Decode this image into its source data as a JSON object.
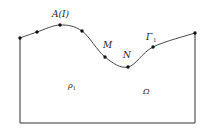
{
  "diagram": {
    "colors": {
      "stroke": "#333333",
      "point": "#111111",
      "background": "#ffffff"
    },
    "domain": {
      "left": 20,
      "right": 195,
      "bottom": 123,
      "top_left_y": 38,
      "top_right_y": 33
    },
    "points": [
      {
        "x": 20,
        "y": 38
      },
      {
        "x": 37,
        "y": 32
      },
      {
        "x": 60,
        "y": 25
      },
      {
        "x": 82,
        "y": 31
      },
      {
        "x": 105,
        "y": 57
      },
      {
        "x": 128,
        "y": 67
      },
      {
        "x": 153,
        "y": 47
      },
      {
        "x": 195,
        "y": 33
      }
    ],
    "labels": {
      "a": {
        "main": "A",
        "paren": "(I)",
        "x": 52,
        "y": 17
      },
      "m": {
        "main": "M",
        "x": 103,
        "y": 48
      },
      "n": {
        "main": "N",
        "x": 123,
        "y": 58
      },
      "gamma": {
        "main": "Γ",
        "sub": "1",
        "x": 146,
        "y": 40
      },
      "rho": {
        "main": "ρ",
        "sub": "1",
        "x": 68,
        "y": 88
      },
      "omega": {
        "main": "Ω",
        "x": 143,
        "y": 94
      }
    }
  }
}
